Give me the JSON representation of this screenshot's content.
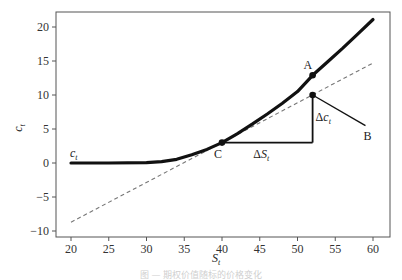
{
  "chart_data": {
    "type": "line",
    "title": "",
    "xlabel": "S_t",
    "ylabel": "c_t",
    "xlim": [
      18,
      62
    ],
    "ylim": [
      -10.5,
      22.5
    ],
    "grid": false,
    "x_ticks": [
      20,
      25,
      30,
      35,
      40,
      45,
      50,
      55,
      60
    ],
    "y_ticks": [
      -10,
      -5,
      0,
      5,
      10,
      15,
      20
    ],
    "series": [
      {
        "name": "c_t",
        "style": "solid-thick",
        "color": "#111111",
        "x": [
          20,
          25,
          30,
          32,
          34,
          36,
          38,
          40,
          42,
          44,
          46,
          48,
          50,
          52,
          54,
          56,
          58,
          60
        ],
        "values": [
          0,
          0,
          0.05,
          0.2,
          0.55,
          1.2,
          2.0,
          3.0,
          4.3,
          5.7,
          7.2,
          8.8,
          10.5,
          12.9,
          14.9,
          16.9,
          19.0,
          21.1
        ]
      },
      {
        "name": "tangent at C",
        "style": "dashed",
        "color": "#777777",
        "x": [
          20,
          60
        ],
        "values": [
          -8.7,
          14.7
        ]
      }
    ],
    "annotations": [
      {
        "label": "A",
        "x": 52,
        "y": 12.9,
        "marker": "dot"
      },
      {
        "label": "C",
        "x": 40,
        "y": 3.0,
        "marker": "dot"
      },
      {
        "label": "B",
        "x": 59,
        "y": 5.5,
        "marker": "none"
      },
      {
        "label": "ΔS_t",
        "x": 46,
        "y": 3.0,
        "note": "horizontal leg from C (40,3) to (52,3)"
      },
      {
        "label": "Δc_t",
        "x": 52,
        "y": 6.5,
        "note": "vertical leg from (52,3) to tangent point (52,10)"
      },
      {
        "label": "c_t",
        "x": 20,
        "y": 0.5,
        "note": "curve label"
      },
      {
        "label": "",
        "x": 52,
        "y": 10.0,
        "marker": "dot",
        "note": "tangent point with segment to B"
      }
    ]
  },
  "axes": {
    "xlabel_main": "S",
    "xlabel_sub": "t",
    "ylabel_main": "c",
    "ylabel_sub": "t",
    "x_tick_labels": [
      "20",
      "25",
      "30",
      "35",
      "40",
      "45",
      "50",
      "55",
      "60"
    ],
    "y_tick_labels": [
      "−10",
      "−5",
      "0",
      "5",
      "10",
      "15",
      "20"
    ]
  },
  "labels": {
    "A": "A",
    "B": "B",
    "C": "C",
    "delta": "Δ",
    "ds_main": "S",
    "ds_sub": "t",
    "dc_main": "c",
    "dc_sub": "t",
    "curve_main": "c",
    "curve_sub": "t"
  },
  "caption": "图 — 期权价值随标的价格变化"
}
